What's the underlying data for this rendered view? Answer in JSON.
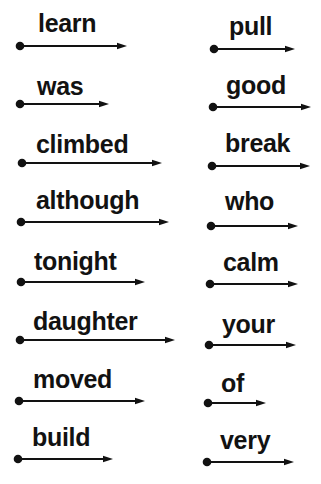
{
  "worksheet": {
    "left_column": [
      {
        "word": "learn"
      },
      {
        "word": "was"
      },
      {
        "word": "climbed"
      },
      {
        "word": "although"
      },
      {
        "word": "tonight"
      },
      {
        "word": "daughter"
      },
      {
        "word": "moved"
      },
      {
        "word": "build"
      }
    ],
    "right_column": [
      {
        "word": "pull"
      },
      {
        "word": "good"
      },
      {
        "word": "break"
      },
      {
        "word": "who"
      },
      {
        "word": "calm"
      },
      {
        "word": "your"
      },
      {
        "word": "of"
      },
      {
        "word": "very"
      }
    ],
    "ink_color": "#121212"
  }
}
